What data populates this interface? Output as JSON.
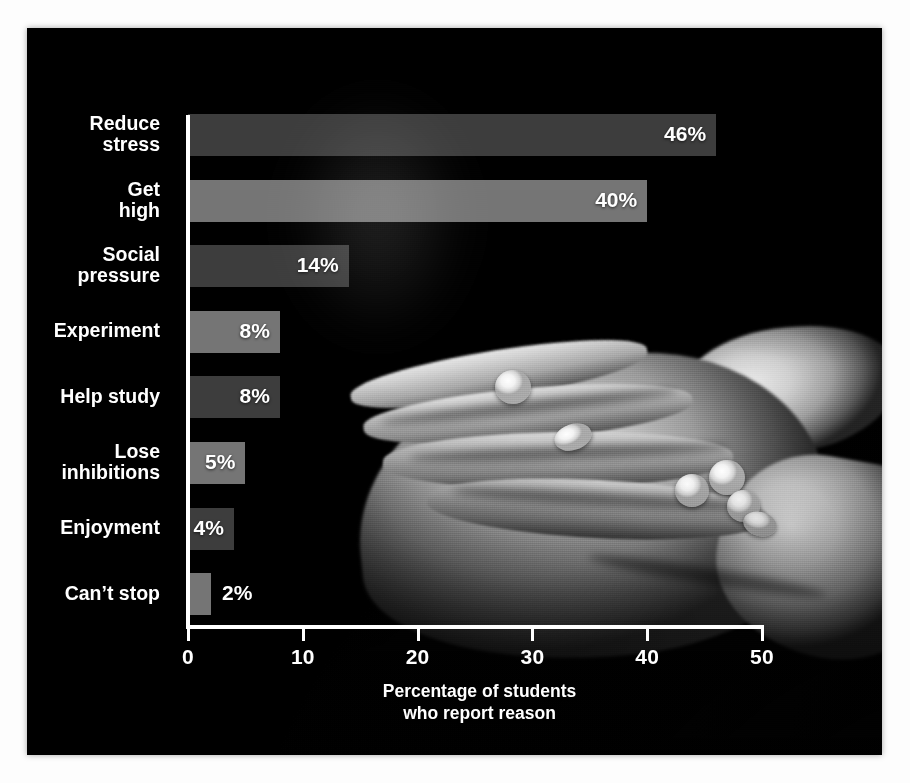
{
  "figure": {
    "media": {
      "type": "photograph",
      "description": "open hand holding white pills",
      "palette": "grayscale"
    }
  },
  "chart_data": {
    "type": "bar",
    "orientation": "horizontal",
    "title": "",
    "subtitle": "",
    "xlabel": "Percentage of students\nwho report reason",
    "ylabel": "",
    "xlim": [
      0,
      50
    ],
    "xticks": [
      0,
      10,
      20,
      30,
      40,
      50
    ],
    "xtick_labels": [
      "0",
      "10",
      "20",
      "30",
      "40",
      "50"
    ],
    "grid": false,
    "legend": false,
    "categories": [
      "Reduce\nstress",
      "Get\nhigh",
      "Social\npressure",
      "Experiment",
      "Help study",
      "Lose\ninhibitions",
      "Enjoyment",
      "Can’t stop"
    ],
    "values": [
      46,
      40,
      14,
      8,
      8,
      5,
      4,
      2
    ],
    "value_labels": [
      "46%",
      "40%",
      "14%",
      "8%",
      "8%",
      "5%",
      "4%",
      "2%"
    ],
    "bar_shades": [
      "dark",
      "light",
      "dark",
      "light",
      "dark",
      "light",
      "dark",
      "light"
    ],
    "label_inside": [
      true,
      true,
      true,
      true,
      true,
      true,
      true,
      false
    ],
    "colors": {
      "bar_light": "#ffffff76",
      "bar_dark": "#ffffff3d",
      "text": "#ffffff",
      "axis": "#ffffff",
      "background": "#000000"
    }
  }
}
